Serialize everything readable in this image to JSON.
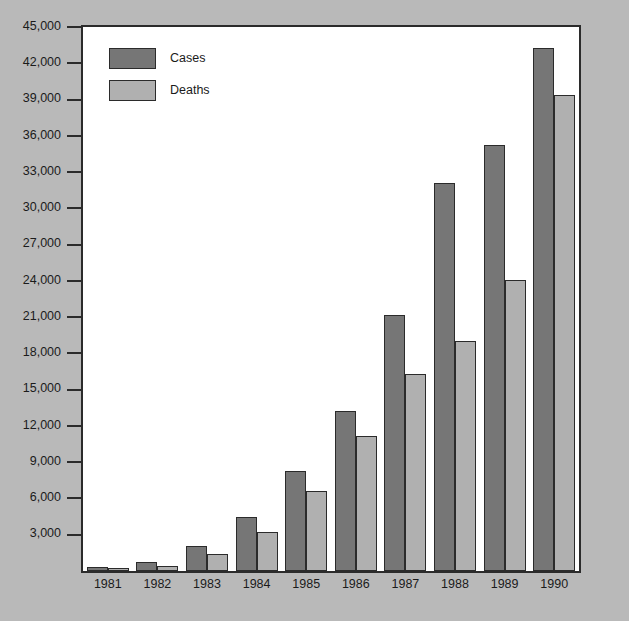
{
  "chart_data": {
    "type": "bar",
    "title": "",
    "subtitle": "",
    "xlabel": "",
    "ylabel": "",
    "categories": [
      "1981",
      "1982",
      "1983",
      "1984",
      "1985",
      "1986",
      "1987",
      "1988",
      "1989",
      "1990"
    ],
    "series": [
      {
        "name": "Cases",
        "color": "#767676",
        "values": [
          330,
          720,
          2100,
          4500,
          8250,
          13200,
          21200,
          32100,
          35200,
          43300
        ]
      },
      {
        "name": "Deaths",
        "color": "#b0b0b0",
        "values": [
          130,
          450,
          1400,
          3200,
          6600,
          11200,
          16300,
          19000,
          24100,
          39400
        ]
      }
    ],
    "ylim": [
      0,
      45000
    ],
    "ytick_step": 3000,
    "yticks": [
      3000,
      6000,
      9000,
      12000,
      15000,
      18000,
      21000,
      24000,
      27000,
      30000,
      33000,
      36000,
      39000,
      42000,
      45000
    ],
    "ytick_labels": [
      "3,000",
      "6,000",
      "9,000",
      "12,000",
      "15,000",
      "18,000",
      "21,000",
      "24,000",
      "27,000",
      "30,000",
      "33,000",
      "36,000",
      "39,000",
      "42,000",
      "45,000"
    ],
    "grid": false,
    "legend_position": "top-left",
    "legend_entries": [
      {
        "label": "Cases",
        "color": "#767676"
      },
      {
        "label": "Deaths",
        "color": "#b0b0b0"
      }
    ],
    "background_color": "#b9b9b9",
    "plot_background_color": "#ffffff",
    "axis_color": "#2b2b2b"
  }
}
